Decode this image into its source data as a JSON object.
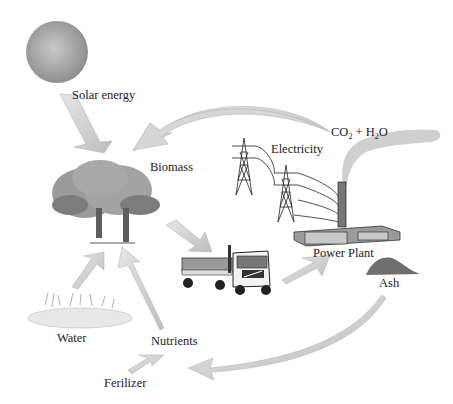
{
  "diagram": {
    "type": "biomass-energy-cycle",
    "nodes": {
      "solar": {
        "label": "Solar energy"
      },
      "biomass": {
        "label": "Biomass"
      },
      "electricity": {
        "label": "Electricity"
      },
      "emissions": {
        "co2": "CO",
        "co2_sub": "2",
        "plus": " + H",
        "h2o_sub": "2",
        "o": "O"
      },
      "power_plant": {
        "label": "Power Plant"
      },
      "ash": {
        "label": "Ash"
      },
      "water": {
        "label": "Water"
      },
      "nutrients": {
        "label": "Nutrients"
      },
      "fertilizer": {
        "label": "Ferilizer"
      }
    },
    "flows": [
      {
        "from": "Solar energy",
        "to": "Biomass"
      },
      {
        "from": "CO2 + H2O",
        "to": "Biomass"
      },
      {
        "from": "Biomass",
        "to": "Truck"
      },
      {
        "from": "Truck",
        "to": "Power Plant"
      },
      {
        "from": "Ash",
        "to": "Nutrients"
      },
      {
        "from": "Water",
        "to": "Biomass"
      },
      {
        "from": "Nutrients",
        "to": "Biomass"
      },
      {
        "from": "Ferilizer",
        "to": "Nutrients"
      }
    ],
    "colors": {
      "arrow": "#d2d2d2",
      "arrow_edge": "#b8b8b8",
      "tree": "#8f8f8f",
      "smoke": "#cfcfcf"
    }
  }
}
